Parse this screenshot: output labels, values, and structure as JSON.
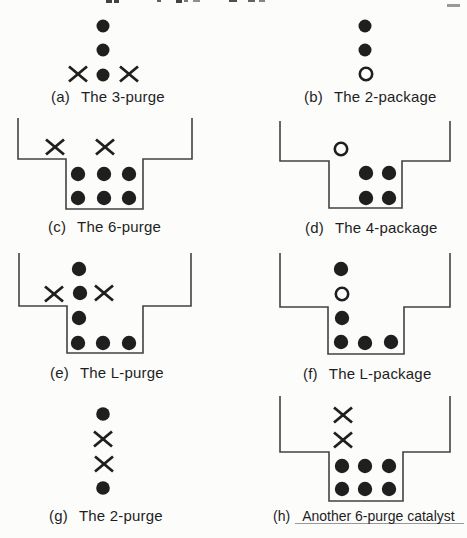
{
  "page": {
    "bg": "#fcfcfb",
    "ink": "#1f1f1f",
    "line_color": "#424242"
  },
  "artifacts": {
    "top_text_fragments": [
      {
        "x": 106,
        "y": 0,
        "w": 6,
        "h": 3,
        "o": 0.85
      },
      {
        "x": 114,
        "y": 0,
        "w": 5,
        "h": 3,
        "o": 0.85
      },
      {
        "x": 157,
        "y": 0,
        "w": 4,
        "h": 2,
        "o": 0.7
      },
      {
        "x": 176,
        "y": 0,
        "w": 6,
        "h": 3,
        "o": 0.85
      },
      {
        "x": 184,
        "y": 0,
        "w": 4,
        "h": 2,
        "o": 0.6
      },
      {
        "x": 193,
        "y": 0,
        "w": 7,
        "h": 2,
        "o": 0.5
      },
      {
        "x": 229,
        "y": 0,
        "w": 8,
        "h": 2,
        "o": 0.8
      },
      {
        "x": 248,
        "y": 0,
        "w": 7,
        "h": 2,
        "o": 0.7
      },
      {
        "x": 259,
        "y": 0,
        "w": 6,
        "h": 2,
        "o": 0.55
      },
      {
        "x": 447,
        "y": 4,
        "w": 13,
        "h": 3,
        "o": 0.45
      }
    ],
    "strike_line": {
      "x1": 295,
      "y1": 523.5,
      "x2": 464,
      "y2": 523.5
    }
  },
  "figures": [
    {
      "id": "a",
      "caption_index": "(a)",
      "caption_title": "The 3-purge",
      "caption_pos": {
        "x": 51,
        "y": 88
      },
      "dot_r": 6.5,
      "container": null,
      "items": [
        {
          "t": "dot",
          "x": 103,
          "y": 26
        },
        {
          "t": "dot",
          "x": 103,
          "y": 50
        },
        {
          "t": "x",
          "x": 78,
          "y": 74
        },
        {
          "t": "dot",
          "x": 103,
          "y": 75
        },
        {
          "t": "x",
          "x": 129,
          "y": 74
        }
      ]
    },
    {
      "id": "b",
      "caption_index": "(b)",
      "caption_title": "The 2-package",
      "caption_pos": {
        "x": 304,
        "y": 88
      },
      "dot_r": 6.5,
      "container": null,
      "items": [
        {
          "t": "dot",
          "x": 365,
          "y": 26
        },
        {
          "t": "dot",
          "x": 365,
          "y": 50
        },
        {
          "t": "ring",
          "x": 366,
          "y": 74
        }
      ]
    },
    {
      "id": "c",
      "caption_index": "(c)",
      "caption_title": "The 6-purge",
      "caption_pos": {
        "x": 48,
        "y": 218
      },
      "dot_r": 7.2,
      "container": [
        [
          18,
          118
        ],
        [
          18,
          159
        ],
        [
          66,
          159
        ],
        [
          66,
          209
        ],
        [
          143,
          209
        ],
        [
          143,
          159
        ],
        [
          192,
          159
        ],
        [
          192,
          118
        ]
      ],
      "items": [
        {
          "t": "x",
          "x": 55,
          "y": 147
        },
        {
          "t": "x",
          "x": 105,
          "y": 147
        },
        {
          "t": "dot",
          "x": 78,
          "y": 174
        },
        {
          "t": "dot",
          "x": 104,
          "y": 174
        },
        {
          "t": "dot",
          "x": 129,
          "y": 174
        },
        {
          "t": "dot",
          "x": 78,
          "y": 198
        },
        {
          "t": "dot",
          "x": 104,
          "y": 198
        },
        {
          "t": "dot",
          "x": 129,
          "y": 198
        }
      ]
    },
    {
      "id": "d",
      "caption_index": "(d)",
      "caption_title": "The 4-package",
      "caption_pos": {
        "x": 305,
        "y": 219
      },
      "dot_r": 7.2,
      "container": [
        [
          280,
          121
        ],
        [
          280,
          161
        ],
        [
          329,
          161
        ],
        [
          329,
          208
        ],
        [
          402,
          208
        ],
        [
          402,
          161
        ],
        [
          450,
          161
        ],
        [
          450,
          121
        ]
      ],
      "items": [
        {
          "t": "ring",
          "x": 341,
          "y": 149
        },
        {
          "t": "dot",
          "x": 366,
          "y": 173
        },
        {
          "t": "dot",
          "x": 389,
          "y": 173
        },
        {
          "t": "dot",
          "x": 366,
          "y": 198
        },
        {
          "t": "dot",
          "x": 389,
          "y": 198
        }
      ]
    },
    {
      "id": "e",
      "caption_index": "(e)",
      "caption_title": "The L-purge",
      "caption_pos": {
        "x": 50,
        "y": 364
      },
      "dot_r": 7.2,
      "container": [
        [
          19,
          253
        ],
        [
          19,
          306
        ],
        [
          67,
          306
        ],
        [
          67,
          353
        ],
        [
          143,
          353
        ],
        [
          143,
          306
        ],
        [
          191,
          306
        ],
        [
          191,
          253
        ]
      ],
      "items": [
        {
          "t": "dot",
          "x": 79,
          "y": 269
        },
        {
          "t": "x",
          "x": 54,
          "y": 294
        },
        {
          "t": "dot",
          "x": 80,
          "y": 293
        },
        {
          "t": "x",
          "x": 104,
          "y": 293
        },
        {
          "t": "dot",
          "x": 79,
          "y": 318
        },
        {
          "t": "dot",
          "x": 78,
          "y": 343
        },
        {
          "t": "dot",
          "x": 103,
          "y": 343
        },
        {
          "t": "dot",
          "x": 129,
          "y": 343
        }
      ]
    },
    {
      "id": "f",
      "caption_index": "(f)",
      "caption_title": "The L-package",
      "caption_pos": {
        "x": 303,
        "y": 365
      },
      "dot_r": 7.2,
      "container": [
        [
          280,
          253
        ],
        [
          280,
          307
        ],
        [
          328,
          307
        ],
        [
          328,
          354
        ],
        [
          404,
          354
        ],
        [
          404,
          307
        ],
        [
          450,
          307
        ],
        [
          450,
          253
        ]
      ],
      "items": [
        {
          "t": "dot",
          "x": 341,
          "y": 269
        },
        {
          "t": "ring",
          "x": 342,
          "y": 294
        },
        {
          "t": "dot",
          "x": 342,
          "y": 318
        },
        {
          "t": "dot",
          "x": 341,
          "y": 342
        },
        {
          "t": "dot",
          "x": 365,
          "y": 343
        },
        {
          "t": "dot",
          "x": 391,
          "y": 342
        }
      ]
    },
    {
      "id": "g",
      "caption_index": "(g)",
      "caption_title": "The 2-purge",
      "caption_pos": {
        "x": 49,
        "y": 507
      },
      "dot_r": 6.8,
      "container": null,
      "items": [
        {
          "t": "dot",
          "x": 103,
          "y": 414
        },
        {
          "t": "x",
          "x": 103,
          "y": 439
        },
        {
          "t": "x",
          "x": 104,
          "y": 464
        },
        {
          "t": "dot",
          "x": 103,
          "y": 488
        }
      ]
    },
    {
      "id": "h",
      "caption_index": "(h)",
      "caption_title": "Another 6-purge catalyst",
      "caption_pos": {
        "x": 273,
        "y": 508
      },
      "dot_r": 7.2,
      "container": [
        [
          280,
          396
        ],
        [
          280,
          452
        ],
        [
          329,
          452
        ],
        [
          329,
          501
        ],
        [
          403,
          501
        ],
        [
          403,
          452
        ],
        [
          450,
          452
        ],
        [
          450,
          396
        ]
      ],
      "items": [
        {
          "t": "x",
          "x": 343,
          "y": 415
        },
        {
          "t": "x",
          "x": 343,
          "y": 440
        },
        {
          "t": "dot",
          "x": 342,
          "y": 466
        },
        {
          "t": "dot",
          "x": 365,
          "y": 466
        },
        {
          "t": "dot",
          "x": 389,
          "y": 466
        },
        {
          "t": "dot",
          "x": 342,
          "y": 489
        },
        {
          "t": "dot",
          "x": 365,
          "y": 489
        },
        {
          "t": "dot",
          "x": 389,
          "y": 489
        }
      ]
    }
  ]
}
